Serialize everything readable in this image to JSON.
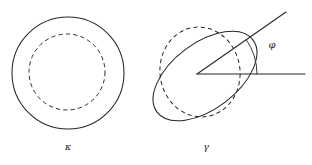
{
  "figure": {
    "background_color": "#ffffff",
    "stroke_color": "#262626",
    "panels": [
      {
        "name": "kappa-panel",
        "label": "κ",
        "label_x": 68,
        "label_y": 150,
        "shapes": [
          {
            "name": "outer-circle",
            "style": "solid",
            "cx": 68,
            "cy": 73,
            "rx": 56,
            "ry": 56,
            "rotation": 0
          },
          {
            "name": "inner-circle",
            "style": "dashed",
            "cx": 67,
            "cy": 72,
            "rx": 38,
            "ry": 38,
            "rotation": 0
          }
        ]
      },
      {
        "name": "gamma-panel",
        "label": "γ",
        "label_x": 206,
        "label_y": 150,
        "shapes": [
          {
            "name": "dashed-ellipse",
            "style": "dashed",
            "cx": 200,
            "cy": 72,
            "rx": 40,
            "ry": 45,
            "rotation": -8
          },
          {
            "name": "tilted-ellipse",
            "style": "solid",
            "cx": 205,
            "cy": 76,
            "rx": 60,
            "ry": 33,
            "rotation": -37
          }
        ],
        "angle": {
          "name": "phi-angle",
          "symbol": "φ",
          "vertex_x": 197,
          "vertex_y": 74,
          "horizontal_end_x": 305,
          "horizontal_end_y": 74,
          "ray_end_x": 286,
          "ray_end_y": 12,
          "degrees": 30,
          "arc_radius": 60,
          "label_x": 272,
          "label_y": 48
        }
      }
    ]
  }
}
